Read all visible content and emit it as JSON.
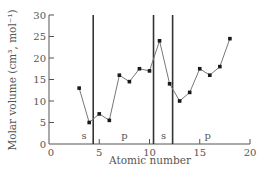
{
  "chart_data": {
    "type": "line",
    "title": "",
    "xlabel": "Atomic number",
    "ylabel": "Molar volume (cm³, mol⁻¹)",
    "xlim": [
      0,
      20
    ],
    "ylim": [
      0,
      30
    ],
    "xticks": [
      0,
      5,
      10,
      15,
      20
    ],
    "yticks": [
      0,
      5,
      10,
      15,
      20,
      25,
      30
    ],
    "grid": false,
    "legend": null,
    "series": [
      {
        "name": "Molar volume",
        "marker": "square",
        "segments": [
          {
            "x": [
              3,
              4,
              5,
              6,
              7,
              8,
              9,
              10,
              11,
              12,
              13,
              14,
              15,
              16,
              17,
              18
            ],
            "y": [
              13.0,
              5.0,
              7.0,
              5.5,
              16.0,
              14.5,
              17.5,
              17.0,
              24.0,
              14.0,
              10.0,
              12.0,
              17.5,
              16.0,
              18.0,
              24.5
            ]
          }
        ]
      }
    ],
    "vertical_lines": [
      4.4,
      10.4,
      12.3
    ],
    "annotations": [
      {
        "text": "s",
        "x": 3.5,
        "y": 1.8
      },
      {
        "text": "p",
        "x": 7.5,
        "y": 1.8
      },
      {
        "text": "s",
        "x": 11.4,
        "y": 1.8
      },
      {
        "text": "p",
        "x": 15.8,
        "y": 1.8
      }
    ],
    "minor_marks": [
      5.0,
      10.0,
      15.0
    ]
  },
  "axes": {
    "xlabel": "Atomic number",
    "ylabel": "Molar volume (cm³, mol⁻¹)",
    "ytick_labels": [
      "0",
      "5",
      "10",
      "15",
      "20",
      "25",
      "30"
    ],
    "xtick_labels": [
      "0",
      "5",
      "10",
      "15",
      "20"
    ]
  },
  "colors": {
    "axis": "#555555",
    "line": "#777777",
    "marker": "#1a1a1a",
    "divider": "#333333"
  }
}
